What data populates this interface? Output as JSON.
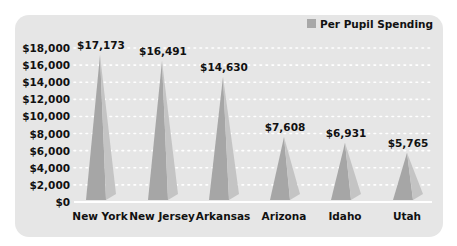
{
  "chart_data": {
    "type": "bar",
    "shape": "pyramid",
    "title": "",
    "categories": [
      "New York",
      "New Jersey",
      "Arkansas",
      "Arizona",
      "Idaho",
      "Utah"
    ],
    "series": [
      {
        "name": "Per Pupil Spending",
        "values": [
          17173,
          16491,
          14630,
          7608,
          6931,
          5765
        ],
        "color": "#a8a8a8"
      }
    ],
    "data_labels": [
      "$17,173",
      "$16,491",
      "$14,630",
      "$7,608",
      "$6,931",
      "$5,765"
    ],
    "xlabel": "",
    "ylabel": "",
    "ylim": [
      0,
      18000
    ],
    "yticks": [
      0,
      2000,
      4000,
      6000,
      8000,
      10000,
      12000,
      14000,
      16000,
      18000
    ],
    "ytick_labels": [
      "$0",
      "$2,000",
      "$4,000",
      "$6,000",
      "$8,000",
      "$10,000",
      "$12,000",
      "$14,000",
      "$16,000",
      "$18,000"
    ],
    "grid": true,
    "grid_style": "dotted white",
    "legend_position": "top-right"
  },
  "legend": {
    "label": "Per Pupil Spending",
    "color": "#a8a8a8"
  },
  "colors": {
    "panel": "#e6e6e6",
    "grid": "#ffffff",
    "pyramid_left": "#a6a6a6",
    "pyramid_right": "#c4c4c4"
  }
}
